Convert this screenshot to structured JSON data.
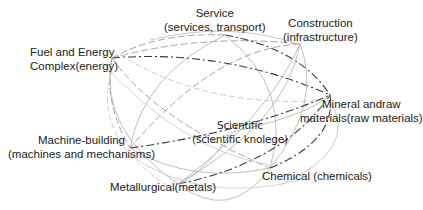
{
  "diagram": {
    "type": "network-of-industries",
    "nodes": [
      {
        "id": "service",
        "line1": "Service",
        "line2": "(services, transport)"
      },
      {
        "id": "construction",
        "line1": "Construction",
        "line2": "(infrastructure)"
      },
      {
        "id": "fuel",
        "line1": "Fuel and Energy",
        "line2": "Complex(energy)"
      },
      {
        "id": "mineral",
        "line1": "Mineral andraw",
        "line2": "materials(raw materials)"
      },
      {
        "id": "machine",
        "line1": "Machine-building",
        "line2": "(machines and mechanisms)"
      },
      {
        "id": "scientific",
        "line1": "Scientific",
        "line2": "(scientific knolege)"
      },
      {
        "id": "metallurgical",
        "line1": "Metallurgical(metals)",
        "line2": ""
      },
      {
        "id": "chemical",
        "line1": "Chemical (chemicals)",
        "line2": ""
      }
    ],
    "line_styles": {
      "solid": "#b8b8b8",
      "dashed": "#9a9a9a",
      "dashdot": "#3a3a3a",
      "dotted": "#c4c4c4"
    },
    "edges": [
      {
        "from": "fuel",
        "to": "construction",
        "style": "dashed"
      },
      {
        "from": "fuel",
        "to": "mineral",
        "style": "dashdot"
      },
      {
        "from": "fuel",
        "to": "chemical",
        "style": "dashed"
      },
      {
        "from": "fuel",
        "to": "metallurgical",
        "style": "solid"
      },
      {
        "from": "fuel",
        "to": "machine",
        "style": "dashed"
      },
      {
        "from": "service",
        "to": "mineral",
        "style": "dashdot"
      },
      {
        "from": "service",
        "to": "machine",
        "style": "solid"
      },
      {
        "from": "service",
        "to": "chemical",
        "style": "solid"
      },
      {
        "from": "service",
        "to": "fuel",
        "style": "dashed"
      },
      {
        "from": "construction",
        "to": "metallurgical",
        "style": "solid"
      },
      {
        "from": "construction",
        "to": "chemical",
        "style": "solid"
      },
      {
        "from": "construction",
        "to": "machine",
        "style": "dashed"
      },
      {
        "from": "machine",
        "to": "mineral",
        "style": "dashdot"
      },
      {
        "from": "machine",
        "to": "chemical",
        "style": "solid"
      },
      {
        "from": "metallurgical",
        "to": "mineral",
        "style": "dashdot"
      },
      {
        "from": "metallurgical",
        "to": "construction",
        "style": "solid"
      },
      {
        "from": "scientific",
        "to": "metallurgical",
        "style": "solid"
      },
      {
        "from": "scientific",
        "to": "mineral",
        "style": "solid"
      },
      {
        "from": "chemical",
        "to": "mineral",
        "style": "dashdot"
      },
      {
        "from": "chemical",
        "to": "metallurgical",
        "style": "solid"
      }
    ]
  }
}
